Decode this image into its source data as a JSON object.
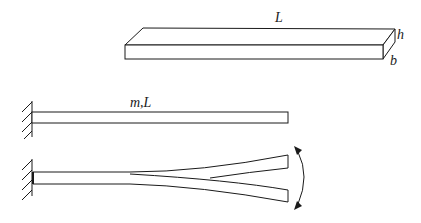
{
  "figure": {
    "bar_3d": {
      "length_label": "L",
      "height_label": "h",
      "width_label": "b"
    },
    "cantilever": {
      "label": "m,L"
    },
    "vibrating_cantilever": {
      "label": ""
    }
  }
}
